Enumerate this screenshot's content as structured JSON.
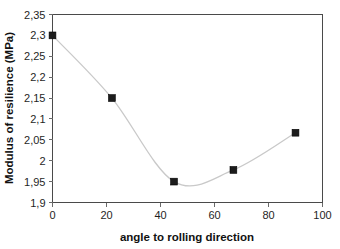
{
  "chart_data": {
    "type": "line",
    "title": "",
    "xlabel": "angle to rolling direction",
    "ylabel": "Modulus of resilience (MPa)",
    "x": [
      0,
      22,
      45,
      67,
      90
    ],
    "values": [
      2.3,
      2.15,
      1.95,
      1.978,
      2.067
    ],
    "series": [
      {
        "name": "Modulus of resilience",
        "values": [
          2.3,
          2.15,
          1.95,
          1.978,
          2.067
        ]
      }
    ],
    "xlim": [
      0,
      100
    ],
    "ylim": [
      1.9,
      2.35
    ],
    "xticks": [
      0,
      20,
      40,
      60,
      80,
      100
    ],
    "yticks": [
      1.9,
      1.95,
      2.0,
      2.05,
      2.1,
      2.15,
      2.2,
      2.25,
      2.3,
      2.35
    ],
    "xtick_labels": [
      "0",
      "20",
      "40",
      "60",
      "80",
      "100"
    ],
    "ytick_labels": [
      "1,9",
      "1,95",
      "2",
      "2,05",
      "2,1",
      "2,15",
      "2,2",
      "2,25",
      "2,3",
      "2,35"
    ],
    "decimal_separator": ",",
    "grid": false,
    "legend": false,
    "legend_position": "none",
    "marker": "square",
    "line_color": "#c9c9c9",
    "marker_color": "#1c1c1c",
    "axis_color": "#4a4a4a",
    "background_color": "#ffffff",
    "smoothing": "spline"
  },
  "axis": {
    "x_title": "angle to rolling direction",
    "y_title": "Modulus of resilience (MPa)"
  }
}
